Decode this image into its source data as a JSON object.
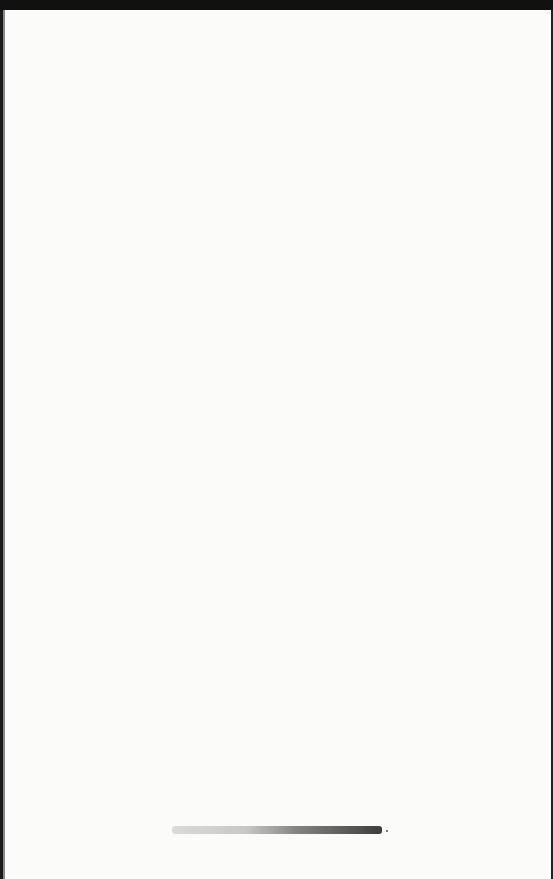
{
  "document": {
    "type": "scanned-page",
    "body_text": "",
    "footer_text": "[illegible printed line]"
  }
}
